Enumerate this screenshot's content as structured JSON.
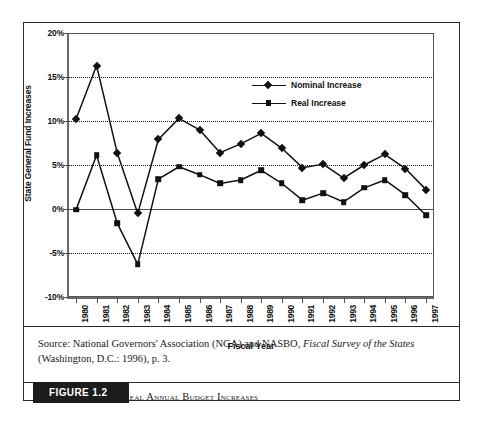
{
  "figure": {
    "tab_label": "FIGURE 1.2",
    "caption": "State Nominal and Real Annual Budget Increases",
    "source_prefix": "Source: National Governors' Association (NGA) and NASBO, ",
    "source_italic": "Fiscal Survey of the States",
    "source_suffix": " (Washington, D.C.: 1996), p. 3."
  },
  "chart_data": {
    "type": "line",
    "title": "",
    "xlabel": "Fiscal Year",
    "ylabel": "State General Fund Increases",
    "ylim": [
      -10,
      20
    ],
    "ytick_labels": [
      "20%",
      "15%",
      "10%",
      "5%",
      "0%",
      "-5%",
      "-10%"
    ],
    "ytick_values": [
      20,
      15,
      10,
      5,
      0,
      -5,
      -10
    ],
    "grid": true,
    "legend_position": "top-right",
    "categories": [
      "1980",
      "1981",
      "1982",
      "1983",
      "1984",
      "1985",
      "1986",
      "1987",
      "1988",
      "1989",
      "1990",
      "1991",
      "1992",
      "1993",
      "1994",
      "1995",
      "1996",
      "1997"
    ],
    "series": [
      {
        "name": "Nominal Increase",
        "marker": "diamond",
        "color": "#111111",
        "values": [
          10.2,
          16.3,
          6.4,
          -0.5,
          7.9,
          10.3,
          9.0,
          6.4,
          7.4,
          8.6,
          6.9,
          4.7,
          5.1,
          3.5,
          5.0,
          6.2,
          4.6,
          2.2
        ]
      },
      {
        "name": "Real Increase",
        "marker": "square",
        "color": "#111111",
        "values": [
          -0.1,
          6.1,
          -1.6,
          -6.3,
          3.4,
          4.8,
          3.9,
          2.9,
          3.3,
          4.4,
          2.9,
          1.0,
          1.8,
          0.8,
          2.4,
          3.3,
          1.6,
          -0.7
        ]
      }
    ]
  }
}
